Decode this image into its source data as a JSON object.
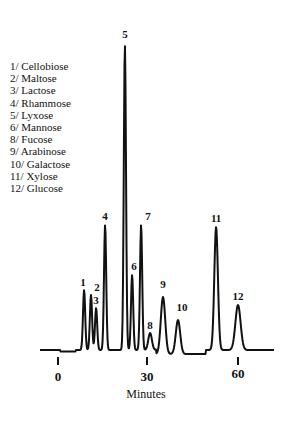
{
  "chart_data": {
    "type": "line",
    "title": "",
    "xlabel": "Minutes",
    "ylabel": "",
    "xlim": [
      -5,
      72
    ],
    "x_ticks": [
      0,
      30,
      60
    ],
    "grid": false,
    "legend_position": "upper-left",
    "legend": [
      "1/ Cellobiose",
      "2/ Maltose",
      "3/ Lactose",
      "4/ Rhammose",
      "5/ Lyxose",
      "6/ Mannose",
      "8/ Fucose",
      "9/ Arabinose",
      "10/ Galactose",
      "11/ Xylose",
      "12/ Glucose"
    ],
    "peaks": [
      {
        "label": "1",
        "name": "Cellobiose",
        "retention_min": 8.7,
        "height": 60
      },
      {
        "label": "2",
        "name": "Maltose",
        "retention_min": 11.0,
        "height": 55
      },
      {
        "label": "3",
        "name": "Lactose",
        "retention_min": 12.7,
        "height": 42
      },
      {
        "label": "4",
        "name": "Rhammose",
        "retention_min": 15.7,
        "height": 125
      },
      {
        "label": "5",
        "name": "Lyxose",
        "retention_min": 22.3,
        "height": 305
      },
      {
        "label": "6",
        "name": "Mannose",
        "retention_min": 24.7,
        "height": 75
      },
      {
        "label": "7",
        "name": "",
        "retention_min": 27.7,
        "height": 125
      },
      {
        "label": "8",
        "name": "Fucose",
        "retention_min": 30.7,
        "height": 17
      },
      {
        "label": "9",
        "name": "Arabinose",
        "retention_min": 35.0,
        "height": 57
      },
      {
        "label": "10",
        "name": "Galactose",
        "retention_min": 40.0,
        "height": 34
      },
      {
        "label": "11",
        "name": "Xylose",
        "retention_min": 52.7,
        "height": 123
      },
      {
        "label": "12",
        "name": "Glucose",
        "retention_min": 60.0,
        "height": 45
      }
    ]
  },
  "legend_items": [
    "1/ Cellobiose",
    "2/ Maltose",
    "3/ Lactose",
    "4/ Rhammose",
    "5/ Lyxose",
    "6/ Mannose",
    "8/ Fucose",
    "9/ Arabinose",
    "10/ Galactose",
    "11/ Xylose",
    "12/ Glucose"
  ],
  "axis": {
    "xlabel": "Minutes",
    "ticks": [
      "0",
      "30",
      "60"
    ]
  },
  "peak_labels": [
    "1",
    "2",
    "3",
    "4",
    "5",
    "6",
    "7",
    "8",
    "9",
    "10",
    "11",
    "12"
  ]
}
